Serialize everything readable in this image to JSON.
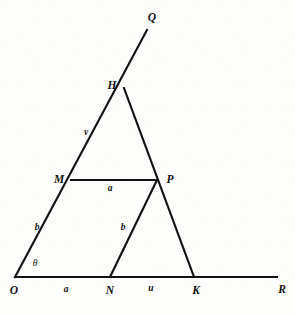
{
  "figure": {
    "type": "geometry-diagram",
    "canvas": {
      "width": 295,
      "height": 314
    },
    "background_color": "#fdfdfc",
    "stroke_color": "#111111",
    "stroke_width": 2.1
  },
  "points": {
    "O": {
      "label": "O",
      "x": 15,
      "y": 277,
      "label_x": 14,
      "label_y": 291
    },
    "N": {
      "label": "N",
      "x": 110,
      "y": 277,
      "label_x": 110,
      "label_y": 291
    },
    "K": {
      "label": "K",
      "x": 194,
      "y": 277,
      "label_x": 196,
      "label_y": 291
    },
    "R": {
      "label": "R",
      "x": 277,
      "y": 277,
      "label_x": 282,
      "label_y": 290
    },
    "M": {
      "label": "M",
      "x": 71,
      "y": 180,
      "label_x": 59,
      "label_y": 180
    },
    "P": {
      "label": "P",
      "x": 157,
      "y": 180,
      "label_x": 170,
      "label_y": 180
    },
    "H": {
      "label": "H",
      "x": 124,
      "y": 88,
      "label_x": 112,
      "label_y": 86
    },
    "Q": {
      "label": "Q",
      "x": 147,
      "y": 30,
      "label_x": 152,
      "label_y": 18
    }
  },
  "segments": [
    {
      "name": "baseline-O-R",
      "from": "O",
      "to": "R"
    },
    {
      "name": "ray-O-Q",
      "from": "O",
      "to": "Q"
    },
    {
      "name": "line-H-K",
      "from": "H",
      "to": "K"
    },
    {
      "name": "segment-N-P",
      "from": "N",
      "to": "P"
    },
    {
      "name": "segment-M-P",
      "from": "M",
      "to": "P"
    }
  ],
  "labels": {
    "angle_theta": {
      "text": "θ",
      "x": 35,
      "y": 264
    },
    "side_ON_a": {
      "text": "a",
      "x": 66,
      "y": 290
    },
    "side_NK_u": {
      "text": "u",
      "x": 151,
      "y": 289
    },
    "side_OM_b": {
      "text": "b",
      "x": 37,
      "y": 228
    },
    "side_MH_v": {
      "text": "v",
      "x": 86,
      "y": 133
    },
    "side_MP_a": {
      "text": "a",
      "x": 110,
      "y": 189
    },
    "side_NP_b": {
      "text": "b",
      "x": 123,
      "y": 228
    }
  }
}
